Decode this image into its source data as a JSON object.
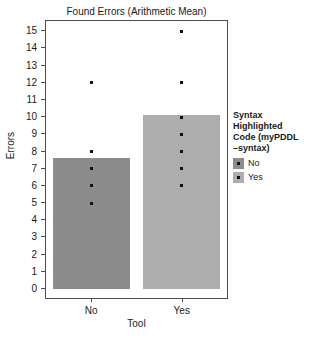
{
  "chart_data": {
    "type": "bar",
    "title": "Found Errors (Arithmetic Mean)",
    "xlabel": "Tool",
    "ylabel": "Errors",
    "categories": [
      "No",
      "Yes"
    ],
    "values": [
      7.6,
      10.15
    ],
    "ylim": [
      0,
      15.6
    ],
    "yticks": [
      0,
      1,
      2,
      3,
      4,
      5,
      6,
      7,
      8,
      9,
      10,
      11,
      12,
      13,
      14,
      15
    ],
    "ytick_labels": [
      "0",
      "1",
      "2",
      "3",
      "4",
      "5",
      "6",
      "7",
      "8",
      "9",
      "10",
      "11",
      "12",
      "13",
      "14",
      "15"
    ],
    "grid": false,
    "legend_position": "right",
    "bar_colors": [
      "#8c8c8c",
      "#adadad"
    ],
    "point_color": "#111111",
    "frame_color": "#4d4d4d",
    "series": [
      {
        "name": "No",
        "category": "No",
        "mean": 7.6,
        "points": [
          12,
          8,
          7,
          6,
          5
        ],
        "color": "#8c8c8c"
      },
      {
        "name": "Yes",
        "category": "Yes",
        "mean": 10.15,
        "points": [
          15,
          12,
          10,
          9,
          8,
          7,
          6
        ],
        "color": "#adadad"
      }
    ],
    "legend": {
      "title": "Syntax Highlighted Code (myPDDL–syntax)",
      "title_lines": [
        "Syntax",
        "Highlighted",
        "Code (myPDDL",
        "–syntax)"
      ],
      "entries": [
        {
          "label": "No",
          "color": "#8c8c8c"
        },
        {
          "label": "Yes",
          "color": "#adadad"
        }
      ]
    }
  }
}
